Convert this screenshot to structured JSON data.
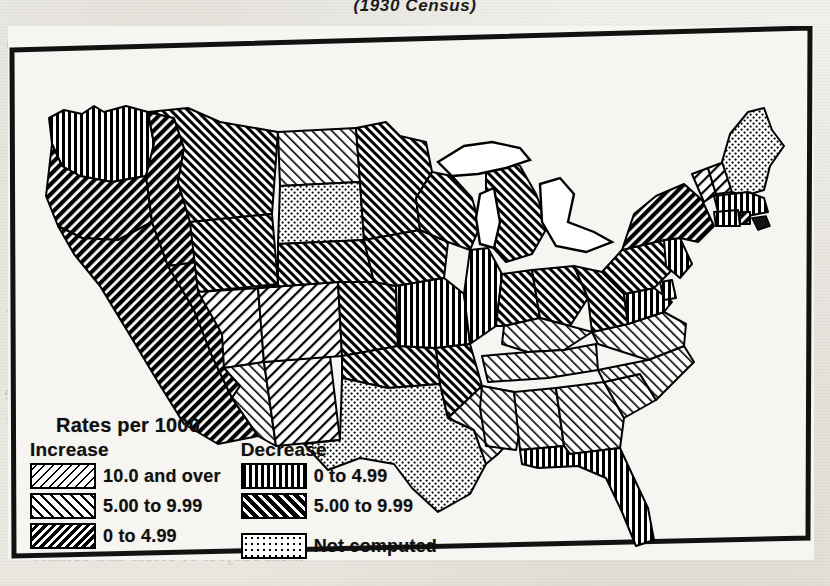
{
  "title": "(1930 Census)",
  "legend": {
    "heading": "Rates per 1000",
    "increase": {
      "header": "Increase",
      "items": [
        {
          "label": "10.0 and over",
          "pattern": "diagonal-fine-backslash",
          "swatch": "sw-inc-high"
        },
        {
          "label": "5.00 to 9.99",
          "pattern": "diagonal-slash",
          "swatch": "sw-inc-mid"
        },
        {
          "label": "0 to 4.99",
          "pattern": "diagonal-dense-backslash",
          "swatch": "sw-inc-low"
        }
      ]
    },
    "decrease": {
      "header": "Decrease",
      "items": [
        {
          "label": "0 to 4.99",
          "pattern": "vertical-lines",
          "swatch": "sw-dec-low"
        },
        {
          "label": "5.00 to 9.99",
          "pattern": "diagonal-bold-slash",
          "swatch": "sw-dec-high"
        }
      ]
    },
    "other": {
      "items": [
        {
          "label": "Not computed",
          "pattern": "stipple",
          "swatch": "sw-notcomp"
        }
      ]
    }
  },
  "map": {
    "name": "united-states-choropleth",
    "frame_color": "#000000",
    "water_color": "#ffffff",
    "regions": [
      {
        "id": "WA",
        "category": "decrease-0-4.99",
        "pattern": "vertical-lines"
      },
      {
        "id": "OR",
        "category": "decrease-5-9.99",
        "pattern": "diagonal-bold-slash"
      },
      {
        "id": "CA",
        "category": "decrease-5-9.99",
        "pattern": "diagonal-bold-slash"
      },
      {
        "id": "ID",
        "category": "decrease-5-9.99",
        "pattern": "diagonal-bold-slash"
      },
      {
        "id": "NV",
        "category": "decrease-5-9.99",
        "pattern": "diagonal-bold-slash"
      },
      {
        "id": "MT",
        "category": "increase-0-4.99",
        "pattern": "diagonal-dense-backslash"
      },
      {
        "id": "WY",
        "category": "increase-0-4.99",
        "pattern": "diagonal-dense-backslash"
      },
      {
        "id": "UT",
        "category": "increase-5-9.99",
        "pattern": "diagonal-slash"
      },
      {
        "id": "AZ",
        "category": "increase-10-over",
        "pattern": "diagonal-fine-backslash"
      },
      {
        "id": "NM",
        "category": "increase-5-9.99",
        "pattern": "diagonal-slash"
      },
      {
        "id": "CO",
        "category": "increase-5-9.99",
        "pattern": "diagonal-slash"
      },
      {
        "id": "ND",
        "category": "increase-10-over",
        "pattern": "diagonal-fine-backslash"
      },
      {
        "id": "SD",
        "category": "not-computed",
        "pattern": "stipple"
      },
      {
        "id": "NE",
        "category": "increase-0-4.99",
        "pattern": "diagonal-dense-backslash"
      },
      {
        "id": "KS",
        "category": "increase-0-4.99",
        "pattern": "diagonal-dense-backslash"
      },
      {
        "id": "OK",
        "category": "increase-0-4.99",
        "pattern": "diagonal-dense-backslash"
      },
      {
        "id": "TX",
        "category": "not-computed",
        "pattern": "stipple"
      },
      {
        "id": "MN",
        "category": "increase-0-4.99",
        "pattern": "diagonal-dense-backslash"
      },
      {
        "id": "IA",
        "category": "increase-0-4.99",
        "pattern": "diagonal-dense-backslash"
      },
      {
        "id": "MO",
        "category": "decrease-0-4.99",
        "pattern": "vertical-lines"
      },
      {
        "id": "AR",
        "category": "increase-0-4.99",
        "pattern": "diagonal-dense-backslash"
      },
      {
        "id": "LA",
        "category": "increase-10-over",
        "pattern": "diagonal-fine-backslash"
      },
      {
        "id": "WI",
        "category": "increase-0-4.99",
        "pattern": "diagonal-dense-backslash"
      },
      {
        "id": "MI",
        "category": "increase-0-4.99",
        "pattern": "diagonal-dense-backslash"
      },
      {
        "id": "IL",
        "category": "decrease-0-4.99",
        "pattern": "vertical-lines"
      },
      {
        "id": "IN",
        "category": "increase-0-4.99",
        "pattern": "diagonal-dense-backslash"
      },
      {
        "id": "OH",
        "category": "increase-0-4.99",
        "pattern": "diagonal-dense-backslash"
      },
      {
        "id": "KY",
        "category": "increase-10-over",
        "pattern": "diagonal-fine-backslash"
      },
      {
        "id": "TN",
        "category": "increase-10-over",
        "pattern": "diagonal-fine-backslash"
      },
      {
        "id": "MS",
        "category": "increase-10-over",
        "pattern": "diagonal-fine-backslash"
      },
      {
        "id": "AL",
        "category": "increase-10-over",
        "pattern": "diagonal-fine-backslash"
      },
      {
        "id": "GA",
        "category": "increase-10-over",
        "pattern": "diagonal-fine-backslash"
      },
      {
        "id": "FL",
        "category": "decrease-0-4.99",
        "pattern": "vertical-lines"
      },
      {
        "id": "SC",
        "category": "increase-10-over",
        "pattern": "diagonal-fine-backslash"
      },
      {
        "id": "NC",
        "category": "increase-10-over",
        "pattern": "diagonal-fine-backslash"
      },
      {
        "id": "VA",
        "category": "increase-10-over",
        "pattern": "diagonal-fine-backslash"
      },
      {
        "id": "WV",
        "category": "increase-0-4.99",
        "pattern": "diagonal-dense-backslash"
      },
      {
        "id": "MD",
        "category": "decrease-0-4.99",
        "pattern": "vertical-lines"
      },
      {
        "id": "DE",
        "category": "decrease-0-4.99",
        "pattern": "vertical-lines"
      },
      {
        "id": "PA",
        "category": "increase-0-4.99",
        "pattern": "diagonal-dense-backslash"
      },
      {
        "id": "NJ",
        "category": "decrease-0-4.99",
        "pattern": "vertical-lines"
      },
      {
        "id": "NY",
        "category": "decrease-5-9.99",
        "pattern": "diagonal-bold-slash"
      },
      {
        "id": "VT",
        "category": "increase-5-9.99",
        "pattern": "diagonal-slash"
      },
      {
        "id": "NH",
        "category": "increase-5-9.99",
        "pattern": "diagonal-slash"
      },
      {
        "id": "ME",
        "category": "not-computed",
        "pattern": "stipple"
      },
      {
        "id": "MA",
        "category": "decrease-0-4.99",
        "pattern": "vertical-lines"
      },
      {
        "id": "CT",
        "category": "decrease-0-4.99",
        "pattern": "vertical-lines"
      },
      {
        "id": "RI",
        "category": "decrease-5-9.99",
        "pattern": "diagonal-bold-slash"
      }
    ]
  },
  "bleed_text": [
    {
      "text": "bodied recruit a list that is ever here; are 5)",
      "x": 6,
      "y": 33
    },
    {
      "text": "eek long-records to elect the the other their safe-ch",
      "x": 10,
      "y": 58
    },
    {
      "text": "se same detailed. find their surpluses in 9,",
      "x": 22,
      "y": 82
    },
    {
      "text": "the disregarded 7 hurt the rest of their",
      "x": 34,
      "y": 106
    },
    {
      "text": "and the",
      "x": 12,
      "y": 222
    },
    {
      "text": "with the",
      "x": 16,
      "y": 248
    },
    {
      "text": "celerated",
      "x": 10,
      "y": 276
    },
    {
      "text": "n- However",
      "x": 6,
      "y": 302
    },
    {
      "text": "mainly to",
      "x": 10,
      "y": 330
    },
    {
      "text": "essential a",
      "x": 8,
      "y": 356
    },
    {
      "text": "electively the",
      "x": 4,
      "y": 382
    },
    {
      "text": "the phases about any",
      "x": 6,
      "y": 410
    },
    {
      "text": "w remembers the can, however, be a continuing",
      "x": 14,
      "y": 462
    },
    {
      "text": "ty advantage with the adverse personations. The parts",
      "x": 20,
      "y": 490
    },
    {
      "text": "ion, no matter what the notices of its equipment",
      "x": 28,
      "y": 516
    },
    {
      "text": "them subject of briefs and details.",
      "x": 34,
      "y": 544
    }
  ]
}
